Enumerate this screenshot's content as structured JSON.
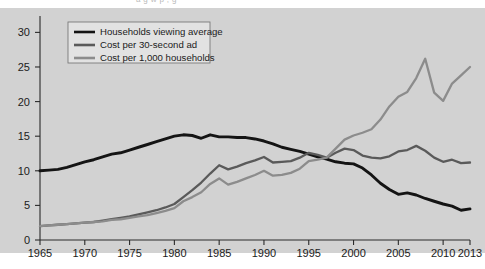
{
  "figure": {
    "background_color": "#ffffff",
    "panel_color": "#d2d2d2",
    "clipped_top_caption": "a  g        w          p          ,        g"
  },
  "legend": {
    "items": [
      {
        "label": "Households viewing average",
        "color": "#141414",
        "width": 2.9
      },
      {
        "label": "Cost per 30-second ad",
        "color": "#5a5a5a",
        "width": 2.3
      },
      {
        "label": "Cost per 1,000 households",
        "color": "#8c8c8c",
        "width": 2.3
      }
    ]
  },
  "chart_data": {
    "type": "line",
    "title": "",
    "xlabel": "",
    "ylabel": "",
    "xlim": [
      1965,
      2013
    ],
    "ylim": [
      0,
      31.5
    ],
    "grid": false,
    "legend_position": "top-left",
    "x_ticks": [
      1965,
      1970,
      1975,
      1980,
      1985,
      1990,
      1995,
      2000,
      2005,
      2010,
      2013
    ],
    "x_tick_labels": [
      "1965",
      "1970",
      "1975",
      "1980",
      "1985",
      "1990",
      "1995",
      "2000",
      "2005",
      "2010",
      "2013"
    ],
    "y_ticks": [
      0,
      5,
      10,
      15,
      20,
      25,
      30
    ],
    "y_tick_labels": [
      "0",
      "5",
      "10",
      "15",
      "20",
      "25",
      "30"
    ],
    "x": [
      1965,
      1966,
      1967,
      1968,
      1969,
      1970,
      1971,
      1972,
      1973,
      1974,
      1975,
      1976,
      1977,
      1978,
      1979,
      1980,
      1981,
      1982,
      1983,
      1984,
      1985,
      1986,
      1987,
      1988,
      1989,
      1990,
      1991,
      1992,
      1993,
      1994,
      1995,
      1996,
      1997,
      1998,
      1999,
      2000,
      2001,
      2002,
      2003,
      2004,
      2005,
      2006,
      2007,
      2008,
      2009,
      2010,
      2011,
      2012,
      2013
    ],
    "series": [
      {
        "name": "Households viewing average",
        "color": "#141414",
        "width": 2.9,
        "values": [
          10.0,
          10.1,
          10.2,
          10.5,
          10.9,
          11.3,
          11.6,
          12.0,
          12.4,
          12.6,
          13.0,
          13.4,
          13.8,
          14.2,
          14.6,
          15.0,
          15.2,
          15.1,
          14.7,
          15.2,
          14.9,
          14.9,
          14.8,
          14.8,
          14.6,
          14.3,
          13.9,
          13.4,
          13.1,
          12.8,
          12.4,
          12.0,
          11.7,
          11.3,
          11.1,
          11.0,
          10.4,
          9.4,
          8.2,
          7.3,
          6.6,
          6.8,
          6.5,
          6.0,
          5.6,
          5.2,
          4.9,
          4.3,
          4.5
        ]
      },
      {
        "name": "Cost per 30-second ad",
        "color": "#5a5a5a",
        "width": 2.3,
        "values": [
          2.0,
          2.1,
          2.2,
          2.3,
          2.4,
          2.5,
          2.6,
          2.8,
          3.0,
          3.2,
          3.4,
          3.7,
          4.0,
          4.3,
          4.7,
          5.2,
          6.2,
          7.2,
          8.3,
          9.6,
          10.8,
          10.2,
          10.6,
          11.1,
          11.5,
          12.0,
          11.2,
          11.3,
          11.4,
          11.9,
          12.6,
          12.3,
          11.9,
          12.6,
          13.2,
          13.0,
          12.2,
          11.9,
          11.8,
          12.1,
          12.8,
          13.0,
          13.6,
          12.9,
          11.9,
          11.3,
          11.6,
          11.1,
          11.2
        ]
      },
      {
        "name": "Cost per 1,000 households",
        "color": "#8c8c8c",
        "width": 2.3,
        "values": [
          2.0,
          2.1,
          2.2,
          2.3,
          2.4,
          2.5,
          2.6,
          2.7,
          2.9,
          3.0,
          3.2,
          3.4,
          3.6,
          3.9,
          4.2,
          4.6,
          5.6,
          6.2,
          6.9,
          8.1,
          8.9,
          8.0,
          8.4,
          8.9,
          9.4,
          10.0,
          9.3,
          9.4,
          9.7,
          10.3,
          11.4,
          11.6,
          11.9,
          13.2,
          14.5,
          15.1,
          15.5,
          16.0,
          17.4,
          19.3,
          20.7,
          21.4,
          23.4,
          26.2,
          21.3,
          20.1,
          22.6,
          23.8,
          25.0
        ]
      }
    ]
  }
}
